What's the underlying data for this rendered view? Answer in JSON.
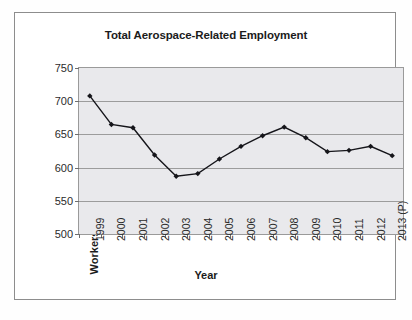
{
  "chart_data": {
    "type": "line",
    "title": "Total Aerospace-Related Employment",
    "xlabel": "Year",
    "ylabel": "Workers in Thousands",
    "categories": [
      "1999",
      "2000",
      "2001",
      "2002",
      "2003",
      "2004",
      "2005",
      "2006",
      "2007",
      "2008",
      "2009",
      "2010",
      "2011",
      "2012",
      "2013 (P)"
    ],
    "values": [
      708,
      665,
      660,
      619,
      587,
      591,
      613,
      632,
      648,
      661,
      645,
      624,
      626,
      632,
      618
    ],
    "series": [
      {
        "name": "Total Aerospace-Related Employment",
        "values": [
          708,
          665,
          660,
          619,
          587,
          591,
          613,
          632,
          648,
          661,
          645,
          624,
          626,
          632,
          618
        ]
      }
    ],
    "ylim": [
      500,
      750
    ],
    "yticks": [
      500,
      550,
      600,
      650,
      700,
      750
    ],
    "ytick_labels": [
      "500",
      "550",
      "600",
      "650",
      "700",
      "750"
    ],
    "grid": true,
    "legend": "none",
    "line_color": "#15151a",
    "marker_color": "#15151a",
    "plot_background": "#e9e9ec"
  },
  "chart": {
    "title": "Total Aerospace-Related Employment",
    "y_axis_title": "Workers in Thousands",
    "x_axis_title": "Year"
  }
}
